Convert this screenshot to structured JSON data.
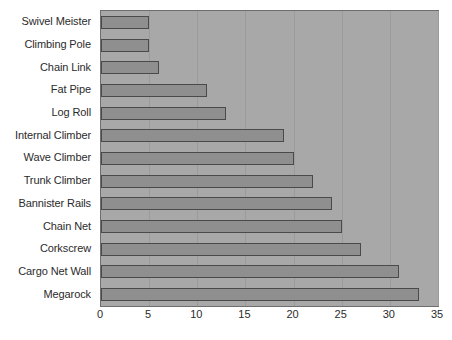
{
  "chart_data": {
    "type": "bar",
    "orientation": "horizontal",
    "title": "",
    "xlabel": "",
    "ylabel": "",
    "xlim": [
      0,
      35
    ],
    "xticks": [
      0,
      5,
      10,
      15,
      20,
      25,
      30,
      35
    ],
    "grid": true,
    "legend": false,
    "categories": [
      "Swivel Meister",
      "Climbing Pole",
      "Chain Link",
      "Fat Pipe",
      "Log Roll",
      "Internal Climber",
      "Wave Climber",
      "Trunk Climber",
      "Bannister Rails",
      "Chain Net",
      "Corkscrew",
      "Cargo Net Wall",
      "Megarock"
    ],
    "values": [
      5,
      5,
      6,
      11,
      13,
      19,
      20,
      22,
      24,
      25,
      27,
      31,
      33
    ]
  },
  "colors": {
    "bar_fill": "#8f8f8f",
    "bar_border": "#4a4a4a",
    "plot_background": "#a8a8a8",
    "gridline": "#9b9b9b",
    "text": "#2b2b2b",
    "page_background": "#ffffff"
  }
}
